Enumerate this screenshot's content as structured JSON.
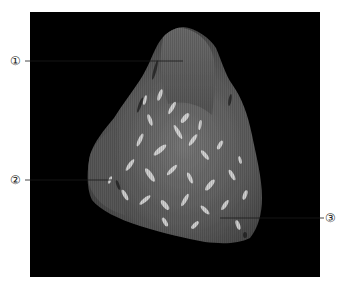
{
  "figure": {
    "background_color": "#000000",
    "page_color": "#ffffff",
    "tissue_base_color": "#5a5a5a",
    "tissue_highlight_color": "#e8e8e8",
    "leader_line_color": "#1a1a1a"
  },
  "callouts": [
    {
      "id": 1,
      "label": "①"
    },
    {
      "id": 2,
      "label": "②"
    },
    {
      "id": 3,
      "label": "③"
    }
  ]
}
